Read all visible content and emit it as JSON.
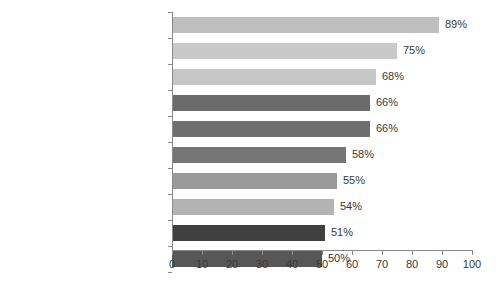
{
  "chart_data": {
    "type": "bar",
    "orientation": "horizontal",
    "title": "",
    "subtitle": "",
    "xlabel": "",
    "ylabel": "",
    "xlim": [
      0,
      100
    ],
    "xticks": [
      0,
      10,
      20,
      30,
      40,
      50,
      60,
      70,
      80,
      90,
      100
    ],
    "grid": false,
    "legend": false,
    "value_label_suffix": "%",
    "categories": [
      "Increased exposure",
      "Increased traffic",
      "Developed loyal fans",
      "Provided marketplace insight",
      "Generated leads",
      "Improved search rankings",
      "Grown business partnerships",
      "Established thought leadership",
      "Improved sales",
      "Reduced marketing expenses"
    ],
    "values": [
      89,
      75,
      68,
      66,
      66,
      58,
      55,
      54,
      51,
      50
    ],
    "value_labels": [
      "89%",
      "75%",
      "68%",
      "66%",
      "66%",
      "58%",
      "55%",
      "54%",
      "51%",
      "50%"
    ],
    "bar_colors": [
      "#bfbfbf",
      "#c8c8c8",
      "#c6c6c6",
      "#6b6b6b",
      "#6e6e6e",
      "#767676",
      "#9a9a9a",
      "#b3b3b3",
      "#404040",
      "#575757"
    ]
  },
  "axis": {
    "tick_labels": [
      "0",
      "10",
      "20",
      "30",
      "40",
      "50",
      "60",
      "70",
      "80",
      "90",
      "100"
    ],
    "line_color": "#8a8a8a"
  }
}
